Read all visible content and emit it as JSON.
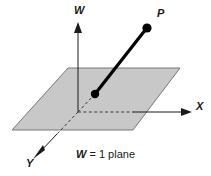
{
  "figure": {
    "caption": {
      "variable": "W",
      "rest": " = 1 plane",
      "full_text": "W = 1 plane"
    },
    "axes": [
      {
        "id": "w",
        "label": "W",
        "direction": "up"
      },
      {
        "id": "x",
        "label": "X",
        "direction": "right"
      },
      {
        "id": "y",
        "label": "Y",
        "direction": "down-left"
      }
    ],
    "points": [
      {
        "id": "p",
        "label": "P",
        "role": "endpoint-above-plane"
      },
      {
        "id": "base",
        "label": "",
        "role": "endpoint-on-plane"
      }
    ],
    "colors": {
      "plane_fill": "#c8c8c8",
      "plane_stroke": "#555555",
      "axis_stroke": "#1a1a1a",
      "vector_stroke": "#000000",
      "dash_stroke": "#333333",
      "background": "#ffffff"
    }
  }
}
